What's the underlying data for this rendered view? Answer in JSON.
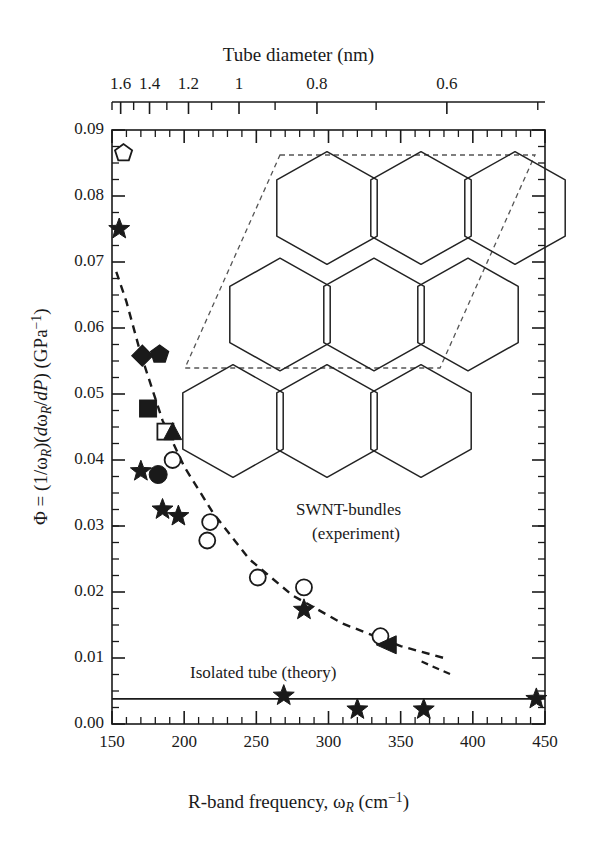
{
  "figure": {
    "top_axis_title": "Tube diameter (nm)",
    "x_axis_title_html": "R-band frequency, ωR (cm⁻¹)",
    "y_axis_title_html": "Φ = (1/ωR)(dωR/dP) (GPa⁻¹)",
    "annotation_bundles_line1": "SWNT-bundles",
    "annotation_bundles_line2": "(experiment)",
    "annotation_isolated": "Isolated tube (theory)",
    "line_color": "#1a1a1a",
    "marker_color": "#1a1a1a",
    "background": "#ffffff"
  },
  "chart_data": {
    "type": "scatter",
    "title": "",
    "xlabel": "R-band frequency, ω_R (cm^-1)",
    "ylabel": "Φ = (1/ω_R)(dω_R/dP) (GPa^-1)",
    "xlim": [
      150,
      450
    ],
    "ylim": [
      0.0,
      0.09
    ],
    "xticks": [
      150,
      200,
      250,
      300,
      350,
      400,
      450
    ],
    "yticks": [
      0.0,
      0.01,
      0.02,
      0.03,
      0.04,
      0.05,
      0.06,
      0.07,
      0.08,
      0.09
    ],
    "ytick_labels": [
      "0.00",
      "0.01",
      "0.02",
      "0.03",
      "0.04",
      "0.05",
      "0.06",
      "0.07",
      "0.08",
      "0.09"
    ],
    "minor_tick_interval_x": 10,
    "minor_tick_interval_y": 0.0025,
    "grid": false,
    "legend": "none",
    "secondary_xaxis": {
      "label": "Tube diameter (nm)",
      "tick_labels": [
        "1.6",
        "1.4",
        "1.2",
        "1",
        "0.8",
        "0.6"
      ],
      "tick_values_nm": [
        1.6,
        1.4,
        1.2,
        1.0,
        0.8,
        0.6
      ],
      "tick_x_frequency": [
        156,
        176,
        203,
        238,
        292,
        382
      ],
      "minor_tick_x_frequency": [
        150,
        165,
        188,
        219,
        263,
        333,
        445
      ]
    },
    "series": [
      {
        "name": "SWNT-bundles (experiment)",
        "marker": "mixed",
        "points": [
          {
            "x": 158,
            "y": 0.0865,
            "marker": "open-pentagon"
          },
          {
            "x": 155,
            "y": 0.075,
            "marker": "filled-star"
          },
          {
            "x": 171,
            "y": 0.0558,
            "marker": "filled-diamond"
          },
          {
            "x": 183,
            "y": 0.056,
            "marker": "filled-pentagon"
          },
          {
            "x": 175,
            "y": 0.0478,
            "marker": "filled-square"
          },
          {
            "x": 187,
            "y": 0.0443,
            "marker": "open-square"
          },
          {
            "x": 192,
            "y": 0.0443,
            "marker": "filled-triangle"
          },
          {
            "x": 192,
            "y": 0.04,
            "marker": "open-circle"
          },
          {
            "x": 170,
            "y": 0.0383,
            "marker": "filled-star"
          },
          {
            "x": 182,
            "y": 0.0378,
            "marker": "filled-circle"
          },
          {
            "x": 185,
            "y": 0.0325,
            "marker": "filled-star"
          },
          {
            "x": 196,
            "y": 0.0315,
            "marker": "filled-star"
          },
          {
            "x": 218,
            "y": 0.0306,
            "marker": "open-circle"
          },
          {
            "x": 216,
            "y": 0.0278,
            "marker": "open-circle"
          },
          {
            "x": 251,
            "y": 0.0222,
            "marker": "open-circle"
          },
          {
            "x": 283,
            "y": 0.0207,
            "marker": "open-circle"
          },
          {
            "x": 283,
            "y": 0.0173,
            "marker": "filled-star"
          },
          {
            "x": 336,
            "y": 0.0133,
            "marker": "open-circle"
          },
          {
            "x": 340,
            "y": 0.012,
            "marker": "filled-triangle-left"
          }
        ],
        "fit_curve": {
          "style": "dashed",
          "x": [
            153,
            160,
            170,
            185,
            200,
            220,
            245,
            275,
            310,
            350,
            380
          ],
          "y": [
            0.0685,
            0.064,
            0.056,
            0.046,
            0.039,
            0.032,
            0.025,
            0.0195,
            0.0152,
            0.0118,
            0.01
          ]
        }
      },
      {
        "name": "Isolated tube (theory)",
        "marker": "filled-star",
        "line_style": "solid",
        "line_y": 0.0038,
        "points": [
          {
            "x": 269,
            "y": 0.0043,
            "marker": "filled-star"
          },
          {
            "x": 320,
            "y": 0.0022,
            "marker": "filled-star"
          },
          {
            "x": 366,
            "y": 0.0022,
            "marker": "filled-star"
          },
          {
            "x": 444,
            "y": 0.0038,
            "marker": "filled-star"
          }
        ]
      }
    ],
    "inset": {
      "description": "Hexagonal SWNT bundle unit cell: 9 hexagonal tube cross-sections arranged in a 3x3 rhombic (parallelogram) lattice outlined with a dashed rhombus",
      "tube_count": 9,
      "rows": 3,
      "columns": 3,
      "outline_style": "dashed-rhombus"
    }
  }
}
